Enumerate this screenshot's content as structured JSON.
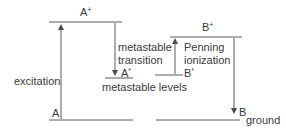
{
  "diagram": {
    "colors": {
      "line": "#5a5a5a",
      "text": "#3a3a3a",
      "background": "#ffffff"
    },
    "levels": {
      "a_plus": {
        "base": "A",
        "sup": "+"
      },
      "a_star": {
        "base": "A",
        "sup": "*"
      },
      "a_ground": {
        "base": "A"
      },
      "b_plus": {
        "base": "B",
        "sup": "+"
      },
      "b_star": {
        "base": "B",
        "sup": "*"
      },
      "b_ground": {
        "base": "B",
        "sub": "ground"
      }
    },
    "labels": {
      "excitation": "excitation",
      "metastable_transition_1": "metastable",
      "metastable_transition_2": "transition",
      "penning_1": "Penning",
      "penning_2": "ionization",
      "metastable_levels": "metastable levels"
    }
  }
}
